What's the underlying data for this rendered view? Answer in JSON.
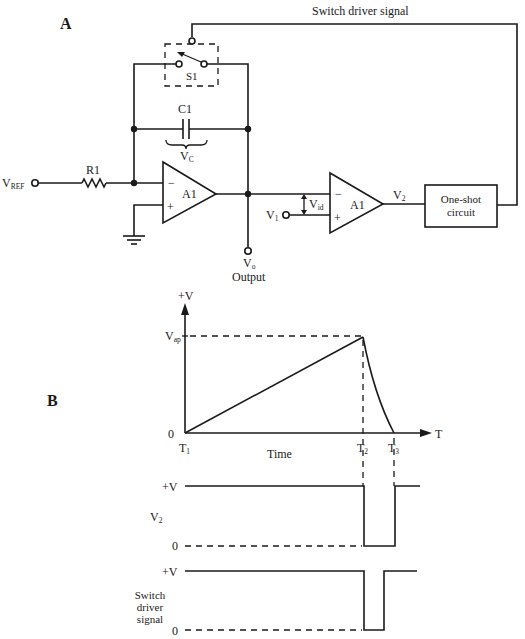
{
  "figure": {
    "panel_a_label": "A",
    "panel_b_label": "B"
  },
  "circuit": {
    "feedback_label": "Switch driver signal",
    "switch_label": "S1",
    "capacitor_label": "C1",
    "capacitor_voltage": {
      "main": "V",
      "sub": "C"
    },
    "resistor_label": "R1",
    "vref": {
      "main": "V",
      "sub": "REF"
    },
    "integrator_opamp": {
      "label": "A1",
      "minus": "−",
      "plus": "+"
    },
    "comparator_opamp": {
      "label": "A1",
      "minus": "−",
      "plus": "+"
    },
    "vo": {
      "main": "V",
      "sub": "o"
    },
    "output_label": "Output",
    "v1": {
      "main": "V",
      "sub": "1"
    },
    "vid": {
      "main": "V",
      "sub": "id"
    },
    "v2": {
      "main": "V",
      "sub": "2"
    },
    "one_shot": {
      "line1": "One-shot",
      "line2": "circuit"
    }
  },
  "timing": {
    "ramp_graph": {
      "y_axis_top_label": "+V",
      "peak_label": {
        "main": "V",
        "sub": "ap"
      },
      "origin_label": "0",
      "x_axis_label": "T",
      "x_axis_title": "Time",
      "t1": {
        "main": "T",
        "sub": "1"
      },
      "t2": {
        "main": "T",
        "sub": "2"
      },
      "t3": {
        "main": "T",
        "sub": "3"
      }
    },
    "v2_graph": {
      "name": {
        "main": "V",
        "sub": "2"
      },
      "high_label": "+V",
      "low_label": "0"
    },
    "switch_graph": {
      "name_line1": "Switch",
      "name_line2": "driver",
      "name_line3": "signal",
      "high_label": "+V",
      "low_label": "0"
    }
  }
}
